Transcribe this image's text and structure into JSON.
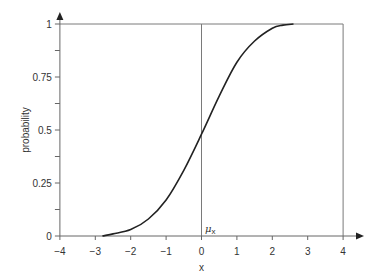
{
  "chart_data": {
    "type": "line",
    "title": "",
    "xlabel": "x",
    "ylabel": "probability",
    "xlim": [
      -4,
      4
    ],
    "ylim": [
      0,
      1
    ],
    "x_ticks": [
      -4,
      -3,
      -2,
      -1,
      0,
      1,
      2,
      3,
      4
    ],
    "x_tick_labels": [
      "−4",
      "−3",
      "−2",
      "−1",
      "0",
      "1",
      "2",
      "3",
      "4"
    ],
    "y_ticks": [
      0,
      0.25,
      0.5,
      0.75,
      1
    ],
    "y_tick_labels": [
      "0",
      "0.25",
      "0.5",
      "0.75",
      "1"
    ],
    "y_minor_ticks": [
      0.125,
      0.375,
      0.625,
      0.875
    ],
    "grid": false,
    "legend": null,
    "annotations": [
      {
        "text": "μx",
        "x": 0,
        "y": 0,
        "description": "mean marker label at vertical line x=0"
      }
    ],
    "reference_lines": [
      {
        "type": "horizontal",
        "y": 1,
        "from_x": -4,
        "to_x": 4
      },
      {
        "type": "vertical",
        "x": 0,
        "from_y": 0,
        "to_y": 1
      },
      {
        "type": "vertical",
        "x": 4,
        "from_y": 0,
        "to_y": 1
      }
    ],
    "series": [
      {
        "name": "cumulative distribution",
        "x": [
          -2.8,
          -2.5,
          -2.0,
          -1.5,
          -1.0,
          -0.5,
          0.0,
          0.5,
          1.0,
          1.5,
          2.0,
          2.3,
          2.6
        ],
        "values": [
          0.0,
          0.01,
          0.03,
          0.08,
          0.17,
          0.31,
          0.48,
          0.66,
          0.82,
          0.92,
          0.98,
          0.995,
          1.0
        ]
      }
    ]
  },
  "labels": {
    "xlabel": "x",
    "ylabel": "probability",
    "mu": "μ",
    "mu_sub": "x"
  }
}
